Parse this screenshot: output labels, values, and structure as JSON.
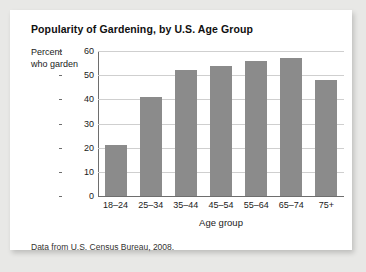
{
  "card": {
    "title": "Popularity of Gardening, by U.S. Age Group",
    "source_note": "Data from U.S. Census Bureau, 2008.",
    "background_color": "#ffffff",
    "page_background_color": "#e8e8e6"
  },
  "chart_data": {
    "type": "bar",
    "title": "Popularity of Gardening, by U.S. Age Group",
    "categories": [
      "18–24",
      "25–34",
      "35–44",
      "45–54",
      "55–64",
      "65–74",
      "75+"
    ],
    "values": [
      21,
      41,
      52,
      54,
      56,
      57,
      48
    ],
    "xlabel": "Age group",
    "ylabel": "Percent who garden",
    "ylabel_line1": "Percent",
    "ylabel_line2": "who garden",
    "ylim": [
      0,
      60
    ],
    "yticks": [
      0,
      10,
      20,
      30,
      40,
      50,
      60
    ],
    "ytick_labels": [
      "0",
      "10",
      "20",
      "30",
      "40",
      "50",
      "60"
    ],
    "grid": true,
    "grid_axis": "y",
    "legend": false,
    "bar_color": "#8b8b8b",
    "grid_color": "#cfcfcf",
    "axis_color": "#6e6e6e"
  }
}
